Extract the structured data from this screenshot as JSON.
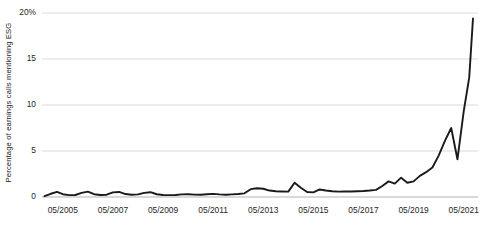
{
  "chart_data": {
    "type": "line",
    "title": "",
    "subtitle": "",
    "xlabel": "",
    "ylabel": "Percentage of earnings calls mentioning ESG",
    "ylim": [
      0,
      20
    ],
    "yticks": [
      0,
      5,
      10,
      15,
      20
    ],
    "ytick_labels": [
      "0",
      "5",
      "10",
      "15",
      "20%"
    ],
    "xtick_labels": [
      "05/2005",
      "05/2007",
      "05/2009",
      "05/2011",
      "05/2013",
      "05/2015",
      "05/2017",
      "05/2019",
      "05/2021"
    ],
    "xtick_values": [
      2005.33,
      2007.33,
      2009.33,
      2011.33,
      2013.33,
      2015.33,
      2017.33,
      2019.33,
      2021.33
    ],
    "xlim": [
      2004.5,
      2021.9
    ],
    "grid": "horizontal",
    "legend": "none",
    "line_color": "#1a1a1a",
    "grid_color": "#d4d4d4",
    "series": [
      {
        "name": "Percentage of earnings calls mentioning ESG",
        "x": [
          2004.6,
          2004.85,
          2005.1,
          2005.33,
          2005.58,
          2005.83,
          2006.08,
          2006.33,
          2006.58,
          2006.83,
          2007.08,
          2007.33,
          2007.58,
          2007.83,
          2008.08,
          2008.33,
          2008.58,
          2008.83,
          2009.08,
          2009.33,
          2009.58,
          2009.83,
          2010.08,
          2010.33,
          2010.58,
          2010.83,
          2011.08,
          2011.33,
          2011.58,
          2011.83,
          2012.08,
          2012.33,
          2012.58,
          2012.83,
          2013.08,
          2013.33,
          2013.58,
          2013.83,
          2014.08,
          2014.33,
          2014.58,
          2014.83,
          2015.08,
          2015.33,
          2015.58,
          2015.83,
          2016.08,
          2016.33,
          2016.58,
          2016.83,
          2017.08,
          2017.33,
          2017.58,
          2017.83,
          2018.08,
          2018.33,
          2018.58,
          2018.83,
          2019.08,
          2019.33,
          2019.58,
          2019.83,
          2020.08,
          2020.33,
          2020.58,
          2020.83,
          2021.08,
          2021.33,
          2021.55,
          2021.7
        ],
        "y": [
          0.1,
          0.35,
          0.55,
          0.3,
          0.2,
          0.22,
          0.45,
          0.58,
          0.3,
          0.22,
          0.25,
          0.5,
          0.55,
          0.32,
          0.25,
          0.28,
          0.45,
          0.52,
          0.3,
          0.22,
          0.2,
          0.22,
          0.28,
          0.3,
          0.26,
          0.24,
          0.3,
          0.34,
          0.28,
          0.25,
          0.28,
          0.32,
          0.4,
          0.85,
          0.95,
          0.9,
          0.7,
          0.62,
          0.6,
          0.58,
          1.55,
          1.0,
          0.55,
          0.5,
          0.82,
          0.7,
          0.62,
          0.58,
          0.6,
          0.6,
          0.62,
          0.65,
          0.7,
          0.78,
          1.2,
          1.7,
          1.45,
          2.1,
          1.55,
          1.7,
          2.3,
          2.7,
          3.2,
          4.5,
          6.1,
          7.5,
          4.1,
          9.3,
          13.0,
          19.4
        ]
      }
    ],
    "annotations": [],
    "peak_value": 19.4,
    "peak_label": "05/2021"
  }
}
